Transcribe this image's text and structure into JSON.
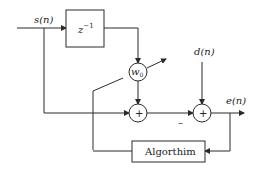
{
  "diagram": {
    "inputs": {
      "signal": "s(n)",
      "desired": "d(n)"
    },
    "output": "e(n)",
    "delay_block": {
      "label_base": "z",
      "label_exp": "−1"
    },
    "weight": {
      "label_base": "w",
      "label_sub": "0"
    },
    "adder1": {
      "symbol": "+"
    },
    "adder2": {
      "symbol": "+",
      "minus_sign": "–"
    },
    "algorithm_block": {
      "label": "Algorthim"
    },
    "colors": {
      "line": "#2a2a2a",
      "background": "#ffffff"
    }
  }
}
